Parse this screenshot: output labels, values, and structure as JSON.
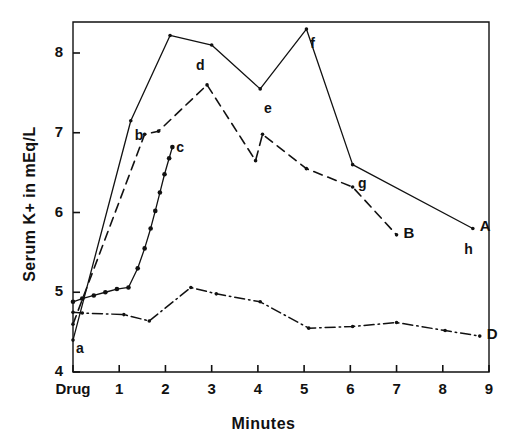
{
  "chart_data": {
    "type": "line",
    "title": "",
    "xlabel": "Minutes",
    "ylabel": "Serum K+ in mEq/L",
    "xlim": [
      0,
      9
    ],
    "ylim": [
      4,
      8.5
    ],
    "grid": false,
    "legend": "none",
    "x_tick_labels": [
      "Drug",
      "1",
      "2",
      "3",
      "4",
      "5",
      "6",
      "7",
      "8",
      "9"
    ],
    "x_tick_values": [
      0,
      1,
      2,
      3,
      4,
      5,
      6,
      7,
      8,
      9
    ],
    "y_tick_labels": [
      "4",
      "5",
      "6",
      "7",
      "8"
    ],
    "y_tick_values": [
      4,
      5,
      6,
      7,
      8
    ],
    "series": [
      {
        "name": "A",
        "style": "solid",
        "end_label": "A",
        "points": [
          {
            "x": 0.0,
            "y": 4.4
          },
          {
            "x": 1.25,
            "y": 7.15
          },
          {
            "x": 2.1,
            "y": 8.22
          },
          {
            "x": 3.0,
            "y": 8.1
          },
          {
            "x": 4.05,
            "y": 7.55
          },
          {
            "x": 5.05,
            "y": 8.3
          },
          {
            "x": 6.05,
            "y": 6.6
          },
          {
            "x": 8.65,
            "y": 5.8
          }
        ]
      },
      {
        "name": "B",
        "style": "dashed",
        "end_label": "B",
        "points": [
          {
            "x": 0.0,
            "y": 4.6
          },
          {
            "x": 1.55,
            "y": 6.98
          },
          {
            "x": 1.85,
            "y": 7.02
          },
          {
            "x": 2.9,
            "y": 7.6
          },
          {
            "x": 3.95,
            "y": 6.65
          },
          {
            "x": 4.1,
            "y": 6.98
          },
          {
            "x": 5.05,
            "y": 6.55
          },
          {
            "x": 6.05,
            "y": 6.32
          },
          {
            "x": 7.0,
            "y": 5.72
          }
        ]
      },
      {
        "name": "C",
        "style": "dotted-markers",
        "end_label": "c",
        "points": [
          {
            "x": 0.0,
            "y": 4.88
          },
          {
            "x": 0.2,
            "y": 4.92
          },
          {
            "x": 0.45,
            "y": 4.96
          },
          {
            "x": 0.7,
            "y": 5.0
          },
          {
            "x": 0.95,
            "y": 5.04
          },
          {
            "x": 1.2,
            "y": 5.06
          },
          {
            "x": 1.4,
            "y": 5.3
          },
          {
            "x": 1.55,
            "y": 5.55
          },
          {
            "x": 1.68,
            "y": 5.8
          },
          {
            "x": 1.78,
            "y": 6.02
          },
          {
            "x": 1.88,
            "y": 6.25
          },
          {
            "x": 1.98,
            "y": 6.48
          },
          {
            "x": 2.08,
            "y": 6.68
          },
          {
            "x": 2.15,
            "y": 6.82
          }
        ]
      },
      {
        "name": "D",
        "style": "dash-dot",
        "end_label": "D",
        "points": [
          {
            "x": 0.0,
            "y": 4.75
          },
          {
            "x": 0.2,
            "y": 4.74
          },
          {
            "x": 1.1,
            "y": 4.72
          },
          {
            "x": 1.65,
            "y": 4.64
          },
          {
            "x": 2.55,
            "y": 5.06
          },
          {
            "x": 3.1,
            "y": 4.98
          },
          {
            "x": 4.05,
            "y": 4.88
          },
          {
            "x": 5.1,
            "y": 4.55
          },
          {
            "x": 6.05,
            "y": 4.57
          },
          {
            "x": 7.0,
            "y": 4.62
          },
          {
            "x": 8.05,
            "y": 4.52
          },
          {
            "x": 8.8,
            "y": 4.45
          }
        ]
      }
    ],
    "point_annotations": [
      {
        "label": "a",
        "x": 0.15,
        "y": 4.27
      },
      {
        "label": "b",
        "x": 1.42,
        "y": 6.95
      },
      {
        "label": "c",
        "x": 2.32,
        "y": 6.8
      },
      {
        "label": "d",
        "x": 2.75,
        "y": 7.82
      },
      {
        "label": "e",
        "x": 4.22,
        "y": 7.28
      },
      {
        "label": "f",
        "x": 5.22,
        "y": 8.1
      },
      {
        "label": "g",
        "x": 6.25,
        "y": 6.35
      },
      {
        "label": "h",
        "x": 8.55,
        "y": 5.52
      }
    ]
  },
  "colors": {
    "ink": "#111111",
    "background": "#ffffff"
  }
}
